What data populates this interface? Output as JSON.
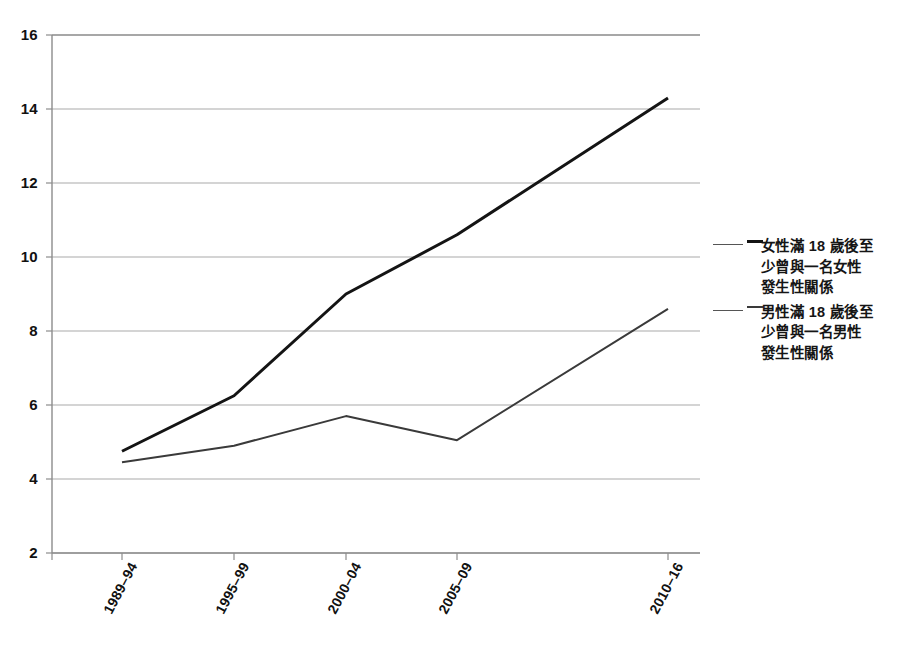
{
  "chart_data": {
    "type": "line",
    "title": "",
    "subtitle": "",
    "xlabel": "",
    "ylabel": "",
    "categories": [
      "1989–94",
      "1995–99",
      "2000–04",
      "2005–09",
      "2010–16"
    ],
    "ylim": [
      2,
      16
    ],
    "yticks": [
      2,
      4,
      6,
      8,
      10,
      12,
      14,
      16
    ],
    "grid": true,
    "legend_position": "right",
    "series": [
      {
        "name": "女性滿 18 歲後至少曾與一名女性發生性關係",
        "values": [
          4.75,
          6.25,
          9.0,
          10.6,
          14.3
        ],
        "color": "#141414",
        "line_width": 3
      },
      {
        "name": "男性滿 18 歲後至少曾與一名男性發生性關係",
        "values": [
          4.45,
          4.9,
          5.7,
          5.05,
          8.6
        ],
        "color": "#3a3a3a",
        "line_width": 2
      }
    ]
  },
  "axis": {
    "y_tick_labels": [
      "16",
      "14",
      "12",
      "10",
      "8",
      "6",
      "4",
      "2"
    ],
    "x_tick_labels": [
      "1989–94",
      "1995–99",
      "2000–04",
      "2005–09",
      "2010–16"
    ]
  },
  "legend": {
    "entries": [
      {
        "label_line1": "女性滿 18 歲後至",
        "label_line2": "少曾與一名女性",
        "label_line3": "發生性關係",
        "full": "女性滿 18 歲後至少曾與一名女性發生性關係"
      },
      {
        "label_line1": "男性滿 18 歲後至",
        "label_line2": "少曾與一名男性",
        "label_line3": "發生性關係",
        "full": "男性滿 18 歲後至少曾與一名男性發生性關係"
      }
    ]
  },
  "colors": {
    "series_female": "#141414",
    "series_male": "#3a3a3a",
    "grid": "#a9a9a9",
    "axis": "#8c8c8c",
    "background": "#ffffff",
    "text": "#111111"
  }
}
